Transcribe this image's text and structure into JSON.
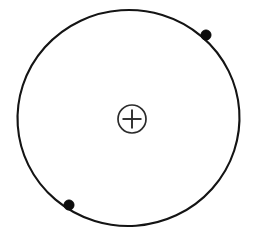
{
  "figure": {
    "name": "bohr-atom-diagram",
    "background_color": "#ffffff",
    "width": 266,
    "height": 234
  },
  "orbit": {
    "name": "electron-orbit",
    "shape": "ellipse",
    "center_x": 128.5,
    "center_y": 118,
    "radius_x": 111,
    "radius_y": 108,
    "rotation_deg": -4,
    "stroke_color": "#141414",
    "stroke_width": 2.1,
    "fill": "none"
  },
  "nucleus": {
    "name": "nucleus-plus-symbol",
    "symbol": "+",
    "charge_label": "+",
    "center_x": 132,
    "center_y": 119,
    "radius": 14,
    "ring_stroke_color": "#2b2b2b",
    "ring_stroke_width": 1.7,
    "plus_arm_length": 9.5,
    "plus_stroke_color": "#2b2b2b",
    "plus_stroke_width": 1.9,
    "fill_color": "#ffffff"
  },
  "electrons": [
    {
      "name": "electron-upper-right",
      "position_label": "upper-right",
      "center_x": 206,
      "center_y": 35,
      "radius": 5.2,
      "color": "#0d0d0d"
    },
    {
      "name": "electron-lower-left",
      "position_label": "lower-left",
      "center_x": 69,
      "center_y": 205,
      "radius": 5.2,
      "color": "#0d0d0d"
    }
  ],
  "chart_data": {
    "type": "scatter",
    "subtitle": "",
    "xlabel": "",
    "ylabel": "",
    "xlim": [
      0,
      266
    ],
    "ylim": [
      0,
      234
    ],
    "grid": false,
    "legend_position": "none",
    "series": [
      {
        "name": "orbit",
        "type": "ellipse",
        "values": [
          {
            "label": "center",
            "x": 128.5,
            "y": 118
          },
          {
            "label": "radius_x",
            "x": 111,
            "y": 0
          },
          {
            "label": "radius_y",
            "x": 0,
            "y": 108
          }
        ]
      },
      {
        "name": "nucleus",
        "type": "point",
        "values": [
          {
            "label": "+",
            "x": 132,
            "y": 119
          }
        ]
      },
      {
        "name": "electrons",
        "type": "point",
        "values": [
          {
            "label": "upper-right",
            "x": 206,
            "y": 35
          },
          {
            "label": "lower-left",
            "x": 69,
            "y": 205
          }
        ]
      }
    ],
    "annotations": [
      {
        "text": "+",
        "x": 132,
        "y": 119
      }
    ]
  }
}
